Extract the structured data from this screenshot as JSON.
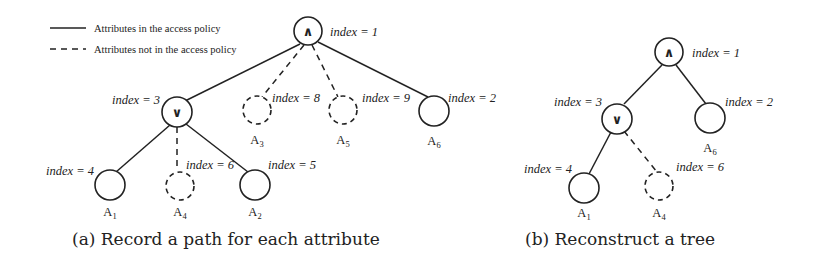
{
  "legend": {
    "solid_label": "Attributes in the access policy",
    "dashed_label": "Attributes not in the access policy"
  },
  "subfigure_a": {
    "caption": "(a) Record a path for each attribute",
    "nodes": [
      {
        "id": "root",
        "type": "AND",
        "symbol": "∧",
        "index_label": "index = 1",
        "style": "solid"
      },
      {
        "id": "or",
        "type": "OR",
        "symbol": "∨",
        "index_label": "index = 3",
        "style": "solid"
      },
      {
        "id": "A3",
        "label": "A",
        "sub": "3",
        "index_label": "index = 8",
        "style": "dashed"
      },
      {
        "id": "A5",
        "label": "A",
        "sub": "5",
        "index_label": "index = 9",
        "style": "dashed"
      },
      {
        "id": "A6",
        "label": "A",
        "sub": "6",
        "index_label": "index = 2",
        "style": "solid"
      },
      {
        "id": "A1",
        "label": "A",
        "sub": "1",
        "index_label": "index = 4",
        "style": "solid"
      },
      {
        "id": "A4",
        "label": "A",
        "sub": "4",
        "index_label": "index = 6",
        "style": "dashed"
      },
      {
        "id": "A2",
        "label": "A",
        "sub": "2",
        "index_label": "index = 5",
        "style": "solid"
      }
    ]
  },
  "subfigure_b": {
    "caption": "(b) Reconstruct a tree",
    "nodes": [
      {
        "id": "root",
        "type": "AND",
        "symbol": "∧",
        "index_label": "index = 1",
        "style": "solid"
      },
      {
        "id": "or",
        "type": "OR",
        "symbol": "∨",
        "index_label": "index = 3",
        "style": "solid"
      },
      {
        "id": "A6",
        "label": "A",
        "sub": "6",
        "index_label": "index = 2",
        "style": "solid"
      },
      {
        "id": "A1",
        "label": "A",
        "sub": "1",
        "index_label": "index = 4",
        "style": "solid"
      },
      {
        "id": "A4",
        "label": "A",
        "sub": "4",
        "index_label": "index = 6",
        "style": "dashed"
      }
    ]
  }
}
